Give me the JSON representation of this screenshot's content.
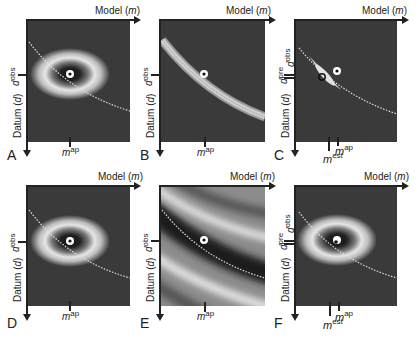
{
  "figure": {
    "axis_labels": {
      "x": "Model (m)",
      "x_prefix": "Model (",
      "x_var": "m",
      "x_suffix": ")",
      "y_prefix": "Datum (",
      "y_var": "d",
      "y_suffix": ")"
    },
    "colors": {
      "background": "#3a3a3a",
      "contour_light": "#e8e8e8",
      "dotted_curve": "#dddddd",
      "axis": "#222222"
    },
    "panels": [
      {
        "id": "A",
        "letter": "A",
        "type": "joint-gaussian",
        "d_labels": [
          {
            "base": "d",
            "sup": "obs"
          }
        ],
        "m_labels": [
          {
            "base": "m",
            "sup": "ap"
          }
        ]
      },
      {
        "id": "B",
        "letter": "B",
        "type": "likelihood-band",
        "d_labels": [
          {
            "base": "d",
            "sup": "obs"
          }
        ],
        "m_labels": [
          {
            "base": "m",
            "sup": "ap"
          }
        ]
      },
      {
        "id": "C",
        "letter": "C",
        "type": "posterior",
        "d_labels": [
          {
            "base": "d",
            "sup": "pre"
          },
          {
            "base": "d",
            "sup": "obs"
          }
        ],
        "m_labels": [
          {
            "base": "m",
            "sup": "est"
          },
          {
            "base": "m",
            "sup": "ap"
          }
        ]
      },
      {
        "id": "D",
        "letter": "D",
        "type": "joint-gaussian",
        "d_labels": [
          {
            "base": "d",
            "sup": "obs"
          }
        ],
        "m_labels": [
          {
            "base": "m",
            "sup": "ap"
          }
        ]
      },
      {
        "id": "E",
        "letter": "E",
        "type": "wide-band",
        "d_labels": [
          {
            "base": "d",
            "sup": "obs"
          }
        ],
        "m_labels": [
          {
            "base": "m",
            "sup": "ap"
          }
        ]
      },
      {
        "id": "F",
        "letter": "F",
        "type": "posterior-wide",
        "d_labels": [
          {
            "base": "d",
            "sup": "pre"
          },
          {
            "base": "d",
            "sup": "obs"
          }
        ],
        "m_labels": [
          {
            "base": "m",
            "sup": "est"
          },
          {
            "base": "m",
            "sup": "ap"
          }
        ]
      }
    ]
  }
}
